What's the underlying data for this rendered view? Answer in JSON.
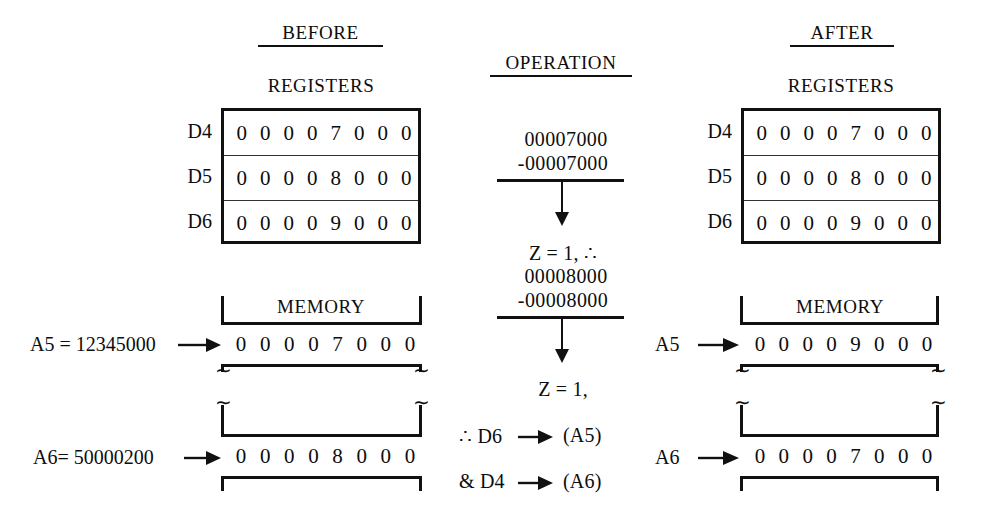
{
  "columns": {
    "before": {
      "heading": "BEFORE",
      "registers_title": "REGISTERS",
      "memory_title": "MEMORY"
    },
    "operation": {
      "heading": "OPERATION"
    },
    "after": {
      "heading": "AFTER",
      "registers_title": "REGISTERS",
      "memory_title": "MEMORY"
    }
  },
  "before": {
    "registers": [
      {
        "name": "D4",
        "digits": [
          "0",
          "0",
          "0",
          "0",
          "7",
          "0",
          "0",
          "0"
        ]
      },
      {
        "name": "D5",
        "digits": [
          "0",
          "0",
          "0",
          "0",
          "8",
          "0",
          "0",
          "0"
        ]
      },
      {
        "name": "D6",
        "digits": [
          "0",
          "0",
          "0",
          "0",
          "9",
          "0",
          "0",
          "0"
        ]
      }
    ],
    "memory": [
      {
        "label": "A5 = 12345000",
        "digits": [
          "0",
          "0",
          "0",
          "0",
          "7",
          "0",
          "0",
          "0"
        ]
      },
      {
        "label": "A6= 50000200",
        "digits": [
          "0",
          "0",
          "0",
          "0",
          "8",
          "0",
          "0",
          "0"
        ]
      }
    ]
  },
  "after": {
    "registers": [
      {
        "name": "D4",
        "digits": [
          "0",
          "0",
          "0",
          "0",
          "7",
          "0",
          "0",
          "0"
        ]
      },
      {
        "name": "D5",
        "digits": [
          "0",
          "0",
          "0",
          "0",
          "8",
          "0",
          "0",
          "0"
        ]
      },
      {
        "name": "D6",
        "digits": [
          "0",
          "0",
          "0",
          "0",
          "9",
          "0",
          "0",
          "0"
        ]
      }
    ],
    "memory": [
      {
        "label": "A5",
        "digits": [
          "0",
          "0",
          "0",
          "0",
          "9",
          "0",
          "0",
          "0"
        ]
      },
      {
        "label": "A6",
        "digits": [
          "0",
          "0",
          "0",
          "0",
          "7",
          "0",
          "0",
          "0"
        ]
      }
    ]
  },
  "operation": {
    "step1": {
      "operand": "00007000",
      "subtrahend": "-00007000"
    },
    "result1": "Z = 1, ∴",
    "step2": {
      "operand": "00008000",
      "subtrahend": "-00008000"
    },
    "result2": "Z = 1,",
    "conclusion1": "∴ D6",
    "conclusion1_target": "(A5)",
    "conclusion2": "& D4",
    "conclusion2_target": "(A6)"
  },
  "squiggle": "∼",
  "colors": {
    "ink": "#0d0d0d",
    "rule": "#111111"
  }
}
